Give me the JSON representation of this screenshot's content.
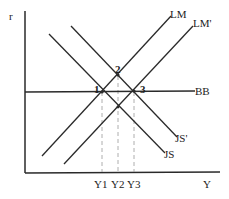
{
  "diagram": {
    "type": "IS-LM-BP diagram",
    "axes": {
      "y_label": "r",
      "x_label": "Y"
    },
    "curves": [
      {
        "name": "LM",
        "label": "LM"
      },
      {
        "name": "LM-prime",
        "label": "LM'"
      },
      {
        "name": "BB",
        "label": "BB"
      },
      {
        "name": "JS-prime",
        "label": "JS'"
      },
      {
        "name": "JS",
        "label": "JS"
      }
    ],
    "points": [
      {
        "label": "1"
      },
      {
        "label": "2"
      },
      {
        "label": "3"
      }
    ],
    "x_ticks": [
      "Y1",
      "Y2",
      "Y3"
    ],
    "colors": {
      "line": "#2a2a2a",
      "dashed": "#999999",
      "background": "#ffffff"
    }
  }
}
